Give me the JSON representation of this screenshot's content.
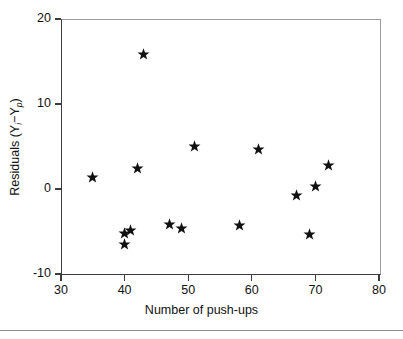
{
  "chart_data": {
    "type": "scatter",
    "title": "",
    "xlabel": "Number of push-ups",
    "ylabel": "Residuals (Yi−Yp)",
    "ylabel_parts": {
      "prefix": "Residuals (Y",
      "sub1": "i",
      "minus": "−Y",
      "sub2": "p",
      "suffix": ")"
    },
    "xlim": [
      30,
      80
    ],
    "ylim": [
      -10,
      20
    ],
    "xticks": [
      30,
      40,
      50,
      60,
      70,
      80
    ],
    "yticks": [
      20,
      10,
      0,
      -10
    ],
    "xticklabels": [
      "30",
      "40",
      "50",
      "60",
      "70",
      "80"
    ],
    "yticklabels": [
      "20",
      "10",
      "0",
      "-10"
    ],
    "grid": false,
    "legend": null,
    "marker": "star",
    "marker_color": "#111111",
    "points": [
      {
        "x": 35,
        "y": 1.4
      },
      {
        "x": 40,
        "y": -5.2
      },
      {
        "x": 40,
        "y": -6.5
      },
      {
        "x": 41,
        "y": -4.9
      },
      {
        "x": 42,
        "y": 2.4
      },
      {
        "x": 43,
        "y": 15.8
      },
      {
        "x": 47,
        "y": -4.2
      },
      {
        "x": 49,
        "y": -4.7
      },
      {
        "x": 51,
        "y": 5.0
      },
      {
        "x": 58,
        "y": -4.3
      },
      {
        "x": 61,
        "y": 4.7
      },
      {
        "x": 67,
        "y": -0.8
      },
      {
        "x": 69,
        "y": -5.4
      },
      {
        "x": 70,
        "y": 0.3
      },
      {
        "x": 72,
        "y": 2.8
      }
    ]
  },
  "geometry": {
    "plot_left": 61,
    "plot_right": 379,
    "plot_top": 19,
    "plot_bottom": 274
  }
}
